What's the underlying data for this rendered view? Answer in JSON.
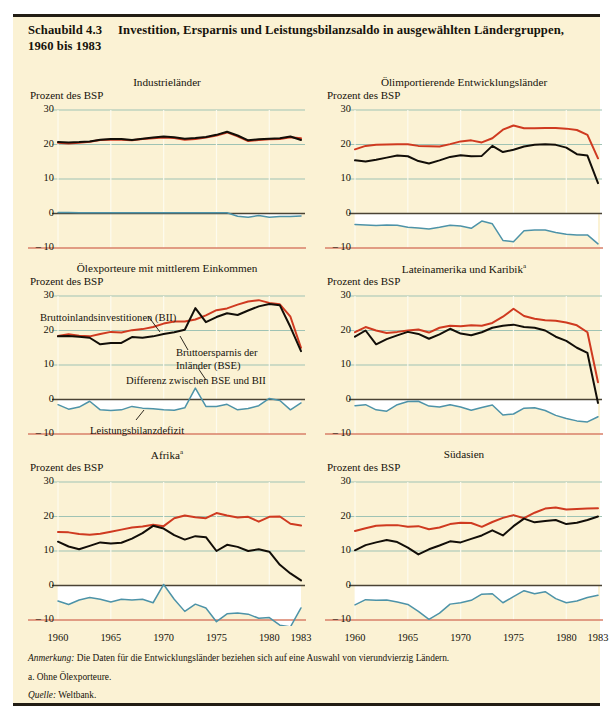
{
  "figure": {
    "number_label": "Schaubild 4.3",
    "title_line1": "Investition, Ersparnis und Leistungsbilanzsaldo in ausgewählten Ländergruppen,",
    "title_line2": "1960 bis 1983",
    "background_color": "#fbf2d4",
    "rule_color": "#221d14"
  },
  "colors": {
    "investment_red": "#cf3a20",
    "savings_black": "#120e08",
    "balance_teal": "#4d93a8",
    "gridline_green": "#9fc3b4",
    "gridline_vertical": "#fdfbee",
    "zero_line": "#4a4334",
    "minus_ten_rule": "#d97f68",
    "fill_white": "#ffffff"
  },
  "axis": {
    "y_label": "Prozent des BSP",
    "y_ticks": [
      "30",
      "20",
      "10",
      "0",
      "– 10"
    ],
    "y_values": [
      30,
      20,
      10,
      0,
      -10
    ],
    "x_ticks": [
      "1960",
      "1965",
      "1970",
      "1975",
      "1980",
      "1983"
    ],
    "x_values": [
      1960,
      1965,
      1970,
      1975,
      1980,
      1983
    ],
    "x_range": [
      1960,
      1983
    ],
    "y_range": [
      -10,
      30
    ]
  },
  "annotations": {
    "bii": "Bruttoinlandsinvestitionen (BII)",
    "bse_line1": "Bruttoersparnis der",
    "bse_line2": "Inländer (BSE)",
    "differenz": "Differenz zwischen BSE und BII",
    "leistungsbilanz": "Leistungsbilanzdefizit"
  },
  "footnotes": {
    "note": "Anmerkung:",
    "note_text": " Die Daten für die Entwicklungsländer beziehen sich auf eine Auswahl von vierundvierzig Ländern.",
    "a": "a. Ohne Ölexporteure.",
    "source": "Quelle:",
    "source_text": " Weltbank."
  },
  "chart_data": [
    {
      "type": "line",
      "title": "Industrieländer",
      "title_footnote": "",
      "xlabel": "",
      "ylabel": "Prozent des BSP",
      "ylim": [
        -10,
        30
      ],
      "xlim": [
        1960,
        1983
      ],
      "grid": true,
      "legend": "none",
      "x": [
        1960,
        1961,
        1962,
        1963,
        1964,
        1965,
        1966,
        1967,
        1968,
        1969,
        1970,
        1971,
        1972,
        1973,
        1974,
        1975,
        1976,
        1977,
        1978,
        1979,
        1980,
        1981,
        1982,
        1983
      ],
      "series": [
        {
          "name": "Bruttoinlandsinvestitionen (BII)",
          "color": "#cf3a20",
          "values": [
            20.5,
            20.3,
            20.5,
            20.8,
            21.3,
            21.4,
            21.4,
            21.2,
            21.6,
            21.8,
            22.0,
            21.9,
            21.4,
            21.6,
            22.0,
            22.6,
            23.5,
            22.4,
            21.0,
            21.3,
            21.5,
            21.6,
            22.1,
            21.8,
            21.0
          ]
        },
        {
          "name": "Bruttoersparnis der Inländer (BSE)",
          "color": "#120e08",
          "values": [
            20.7,
            20.6,
            20.7,
            20.9,
            21.4,
            21.6,
            21.6,
            21.3,
            21.7,
            22.0,
            22.3,
            22.1,
            21.7,
            21.9,
            22.2,
            22.8,
            23.7,
            22.6,
            21.2,
            21.5,
            21.7,
            21.8,
            22.3,
            21.3,
            20.1
          ]
        },
        {
          "name": "Differenz zwischen BSE und BII (Leistungsbilanzdefizit)",
          "color": "#4d93a8",
          "values": [
            0.3,
            0.3,
            0.2,
            0.2,
            0.2,
            0.2,
            0.2,
            0.2,
            0.2,
            0.2,
            0.2,
            0.2,
            0.2,
            0.2,
            0.2,
            0.2,
            0.2,
            -0.8,
            -1.1,
            -0.6,
            -1.1,
            -0.9,
            -0.9,
            -0.7,
            -0.6
          ]
        }
      ]
    },
    {
      "type": "line",
      "title": "Ölimportierende Entwicklungsländer",
      "title_footnote": "",
      "xlabel": "",
      "ylabel": "Prozent des BSP",
      "ylim": [
        -10,
        30
      ],
      "xlim": [
        1960,
        1983
      ],
      "grid": true,
      "legend": "none",
      "x": [
        1960,
        1961,
        1962,
        1963,
        1964,
        1965,
        1966,
        1967,
        1968,
        1969,
        1970,
        1971,
        1972,
        1973,
        1974,
        1975,
        1976,
        1977,
        1978,
        1979,
        1980,
        1981,
        1982,
        1983
      ],
      "series": [
        {
          "name": "Bruttoinlandsinvestitionen (BII)",
          "color": "#cf3a20",
          "values": [
            18.6,
            19.6,
            19.9,
            20.0,
            20.1,
            20.1,
            19.6,
            19.5,
            19.4,
            20.1,
            20.9,
            21.2,
            20.6,
            21.8,
            24.3,
            25.5,
            24.7,
            24.7,
            24.8,
            24.8,
            24.6,
            24.2,
            22.8,
            16.0
          ]
        },
        {
          "name": "Bruttoersparnis der Inländer (BSE)",
          "color": "#120e08",
          "values": [
            15.4,
            15.1,
            15.6,
            16.2,
            16.8,
            16.6,
            15.2,
            14.5,
            15.4,
            16.4,
            16.9,
            16.6,
            16.7,
            19.6,
            17.8,
            18.5,
            19.4,
            19.9,
            20.1,
            19.9,
            19.1,
            17.2,
            16.8,
            8.8
          ]
        },
        {
          "name": "Differenz zwischen BSE und BII (Leistungsbilanzdefizit)",
          "color": "#4d93a8",
          "values": [
            -3.2,
            -3.3,
            -3.5,
            -3.3,
            -3.4,
            -4.0,
            -4.2,
            -4.5,
            -4.0,
            -3.4,
            -3.6,
            -4.3,
            -2.2,
            -3.0,
            -7.8,
            -8.2,
            -5.0,
            -4.8,
            -4.8,
            -5.5,
            -6.0,
            -6.2,
            -6.2,
            -8.8
          ]
        }
      ]
    },
    {
      "type": "line",
      "title": "Ölexporteure mit mittlerem Einkommen",
      "title_footnote": "",
      "xlabel": "",
      "ylabel": "Prozent des BSP",
      "ylim": [
        -10,
        30
      ],
      "xlim": [
        1960,
        1983
      ],
      "grid": true,
      "legend": "inline-annotations",
      "x": [
        1960,
        1961,
        1962,
        1963,
        1964,
        1965,
        1966,
        1967,
        1968,
        1969,
        1970,
        1971,
        1972,
        1973,
        1974,
        1975,
        1976,
        1977,
        1978,
        1979,
        1980,
        1981,
        1982,
        1983
      ],
      "series": [
        {
          "name": "Bruttoinlandsinvestitionen (BII)",
          "color": "#cf3a20",
          "values": [
            18.4,
            18.9,
            18.5,
            18.3,
            19.0,
            19.6,
            19.4,
            20.1,
            20.4,
            21.0,
            22.0,
            22.6,
            22.6,
            23.2,
            24.4,
            25.9,
            26.4,
            27.5,
            28.4,
            28.8,
            28.0,
            27.6,
            24.0,
            15.0
          ]
        },
        {
          "name": "Bruttoersparnis der Inländer (BSE)",
          "color": "#120e08",
          "values": [
            18.3,
            18.4,
            18.2,
            17.9,
            16.0,
            16.4,
            16.4,
            18.1,
            17.9,
            18.3,
            19.0,
            19.5,
            20.2,
            26.5,
            22.4,
            23.9,
            25.0,
            24.5,
            25.8,
            27.0,
            27.7,
            27.3,
            21.0,
            14.0
          ]
        },
        {
          "name": "Differenz zwischen BSE und BII (Leistungsbilanzdefizit)",
          "color": "#4d93a8",
          "values": [
            -1.5,
            -2.8,
            -2.2,
            -0.5,
            -3.0,
            -3.2,
            -3.0,
            -2.0,
            -2.5,
            -2.7,
            -3.0,
            -3.1,
            -2.4,
            3.3,
            -2.0,
            -2.0,
            -1.4,
            -3.0,
            -2.6,
            -1.8,
            0.3,
            -0.3,
            -3.0,
            -1.0
          ]
        }
      ]
    },
    {
      "type": "line",
      "title": "Lateinamerika und Karibik",
      "title_footnote": "a",
      "xlabel": "",
      "ylabel": "Prozent des BSP",
      "ylim": [
        -10,
        30
      ],
      "xlim": [
        1960,
        1983
      ],
      "grid": true,
      "legend": "none",
      "x": [
        1960,
        1961,
        1962,
        1963,
        1964,
        1965,
        1966,
        1967,
        1968,
        1969,
        1970,
        1971,
        1972,
        1973,
        1974,
        1975,
        1976,
        1977,
        1978,
        1979,
        1980,
        1981,
        1982,
        1983
      ],
      "series": [
        {
          "name": "Bruttoinlandsinvestitionen (BII)",
          "color": "#cf3a20",
          "values": [
            19.5,
            21.0,
            20.0,
            19.3,
            19.6,
            20.0,
            20.3,
            19.4,
            20.8,
            21.4,
            21.2,
            21.5,
            21.4,
            22.2,
            24.0,
            26.3,
            24.2,
            23.4,
            23.0,
            22.8,
            22.3,
            21.5,
            19.5,
            5.0
          ]
        },
        {
          "name": "Bruttoersparnis der Inländer (BSE)",
          "color": "#120e08",
          "values": [
            18.2,
            20.0,
            16.0,
            17.5,
            18.6,
            19.6,
            19.0,
            17.6,
            18.9,
            20.5,
            19.1,
            18.6,
            19.5,
            20.8,
            21.4,
            21.7,
            21.0,
            20.8,
            20.0,
            18.2,
            17.0,
            15.0,
            13.5,
            -1.0
          ]
        },
        {
          "name": "Differenz zwischen BSE und BII (Leistungsbilanzdefizit)",
          "color": "#4d93a8",
          "values": [
            -1.8,
            -1.5,
            -3.0,
            -3.4,
            -1.5,
            -0.6,
            -0.5,
            -1.9,
            -2.2,
            -1.5,
            -2.2,
            -3.1,
            -2.3,
            -1.6,
            -4.5,
            -4.2,
            -2.5,
            -2.4,
            -3.2,
            -4.6,
            -5.5,
            -6.2,
            -6.5,
            -5.0
          ]
        }
      ]
    },
    {
      "type": "line",
      "title": "Afrika",
      "title_footnote": "a",
      "xlabel": "",
      "ylabel": "Prozent des BSP",
      "ylim": [
        -10,
        30
      ],
      "xlim": [
        1960,
        1983
      ],
      "grid": true,
      "legend": "none",
      "x": [
        1960,
        1961,
        1962,
        1963,
        1964,
        1965,
        1966,
        1967,
        1968,
        1969,
        1970,
        1971,
        1972,
        1973,
        1974,
        1975,
        1976,
        1977,
        1978,
        1979,
        1980,
        1981,
        1982,
        1983
      ],
      "series": [
        {
          "name": "Bruttoinlandsinvestitionen (BII)",
          "color": "#cf3a20",
          "values": [
            15.5,
            15.4,
            14.9,
            14.7,
            15.0,
            15.6,
            16.2,
            16.8,
            17.1,
            17.6,
            17.2,
            19.5,
            20.3,
            19.8,
            19.5,
            21.0,
            20.3,
            19.7,
            19.9,
            18.5,
            19.9,
            20.0,
            17.9,
            17.4,
            8.5
          ]
        },
        {
          "name": "Bruttoersparnis der Inländer (BSE)",
          "color": "#120e08",
          "values": [
            12.7,
            11.3,
            10.5,
            11.5,
            12.5,
            12.2,
            12.4,
            13.6,
            15.2,
            17.3,
            16.5,
            14.6,
            13.3,
            14.3,
            14.0,
            10.0,
            11.8,
            11.2,
            10.0,
            10.5,
            9.8,
            6.0,
            3.5,
            1.5
          ]
        },
        {
          "name": "Differenz zwischen BSE und BII (Leistungsbilanzdefizit)",
          "color": "#4d93a8",
          "values": [
            -4.5,
            -5.5,
            -4.2,
            -3.5,
            -4.0,
            -4.8,
            -4.0,
            -4.2,
            -4.0,
            -5.0,
            0.3,
            -4.0,
            -7.5,
            -5.4,
            -6.5,
            -10.5,
            -8.2,
            -8.0,
            -8.3,
            -9.5,
            -9.3,
            -11.5,
            -12.0,
            -6.5
          ]
        }
      ]
    },
    {
      "type": "line",
      "title": "Südasien",
      "title_footnote": "",
      "xlabel": "",
      "ylabel": "Prozent des BSP",
      "ylim": [
        -10,
        30
      ],
      "xlim": [
        1960,
        1983
      ],
      "grid": true,
      "legend": "none",
      "x": [
        1960,
        1961,
        1962,
        1963,
        1964,
        1965,
        1966,
        1967,
        1968,
        1969,
        1970,
        1971,
        1972,
        1973,
        1974,
        1975,
        1976,
        1977,
        1978,
        1979,
        1980,
        1981,
        1982,
        1983
      ],
      "series": [
        {
          "name": "Bruttoinlandsinvestitionen (BII)",
          "color": "#cf3a20",
          "values": [
            15.8,
            16.6,
            17.3,
            17.5,
            17.5,
            17.0,
            17.2,
            16.3,
            16.8,
            17.8,
            18.2,
            18.1,
            17.0,
            18.4,
            19.6,
            20.4,
            19.5,
            21.1,
            22.3,
            22.6,
            22.0,
            22.2,
            22.3,
            22.4
          ]
        },
        {
          "name": "Bruttoersparnis der Inländer (BSE)",
          "color": "#120e08",
          "values": [
            10.2,
            11.7,
            12.5,
            13.2,
            12.6,
            11.0,
            9.0,
            10.5,
            11.6,
            12.8,
            12.5,
            13.5,
            14.5,
            16.0,
            14.5,
            17.2,
            19.4,
            18.3,
            18.7,
            19.0,
            17.8,
            18.2,
            19.0,
            20.0
          ]
        },
        {
          "name": "Differenz zwischen BSE und BII (Leistungsbilanzdefizit)",
          "color": "#4d93a8",
          "values": [
            -5.6,
            -4.1,
            -4.3,
            -4.2,
            -4.8,
            -5.5,
            -7.5,
            -9.8,
            -8.0,
            -5.4,
            -5.0,
            -4.3,
            -2.5,
            -2.4,
            -5.0,
            -3.2,
            -1.5,
            -2.4,
            -1.8,
            -3.8,
            -5.0,
            -4.5,
            -3.5,
            -2.8
          ]
        }
      ]
    }
  ],
  "panel_layout": [
    {
      "left": 15,
      "top": 62
    },
    {
      "left": 312,
      "top": 62
    },
    {
      "left": 15,
      "top": 248
    },
    {
      "left": 312,
      "top": 248
    },
    {
      "left": 15,
      "top": 434
    },
    {
      "left": 312,
      "top": 434
    }
  ]
}
